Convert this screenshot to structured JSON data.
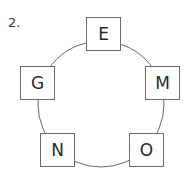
{
  "problem": {
    "number": "2."
  },
  "diagram": {
    "type": "circle-of-letter-boxes",
    "line_color": "#6a6a6a",
    "boxes": [
      {
        "position": "top",
        "letter": "E"
      },
      {
        "position": "right",
        "letter": "M"
      },
      {
        "position": "bottom-right",
        "letter": "O"
      },
      {
        "position": "bottom-left",
        "letter": "N"
      },
      {
        "position": "left",
        "letter": "G"
      }
    ]
  }
}
